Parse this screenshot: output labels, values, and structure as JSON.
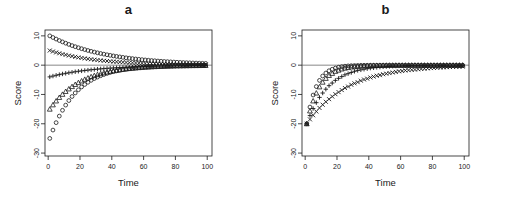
{
  "figure": {
    "panels": [
      {
        "key": "a",
        "title": "a",
        "xlabel": "Time",
        "ylabel": "Score"
      },
      {
        "key": "b",
        "title": "b",
        "xlabel": "Time",
        "ylabel": "Score"
      }
    ]
  },
  "axis": {
    "xticks": [
      0,
      20,
      40,
      60,
      80,
      100
    ],
    "yticks": [
      10,
      0,
      -10,
      -20,
      -30
    ],
    "xlim": [
      -2,
      103
    ],
    "ylim": [
      -31,
      12
    ]
  },
  "chart_data": [
    {
      "type": "scatter",
      "panel": "a",
      "title": "a",
      "xlabel": "Time",
      "ylabel": "Score",
      "xlim": [
        -2,
        103
      ],
      "ylim": [
        -31,
        12
      ],
      "xticks": [
        0,
        20,
        40,
        60,
        80,
        100
      ],
      "yticks": [
        10,
        0,
        -10,
        -20,
        -30
      ],
      "grid": false,
      "legend": "none",
      "reference_line_y": 0,
      "x": [
        1,
        3,
        5,
        7,
        9,
        11,
        13,
        15,
        17,
        19,
        21,
        23,
        25,
        27,
        29,
        31,
        33,
        35,
        37,
        39,
        41,
        43,
        45,
        47,
        49,
        51,
        53,
        55,
        57,
        59,
        61,
        63,
        65,
        67,
        69,
        71,
        73,
        75,
        77,
        79,
        81,
        83,
        85,
        87,
        89,
        91,
        93,
        95,
        97,
        99
      ],
      "series": [
        {
          "name": "start +10",
          "marker": "circle",
          "start_value": 10,
          "values": [
            10.0,
            9.44,
            8.91,
            8.41,
            7.94,
            7.5,
            7.08,
            6.68,
            6.31,
            5.96,
            5.62,
            5.31,
            5.01,
            4.73,
            4.47,
            4.22,
            3.98,
            3.76,
            3.55,
            3.35,
            3.16,
            2.99,
            2.82,
            2.66,
            2.51,
            2.37,
            2.24,
            2.11,
            1.99,
            1.88,
            1.78,
            1.68,
            1.58,
            1.5,
            1.41,
            1.33,
            1.26,
            1.19,
            1.12,
            1.06,
            1.0,
            0.94,
            0.89,
            0.84,
            0.79,
            0.75,
            0.71,
            0.67,
            0.63,
            0.6
          ]
        },
        {
          "name": "start +5",
          "marker": "cross",
          "start_value": 5,
          "values": [
            5.0,
            4.66,
            4.34,
            4.05,
            3.77,
            3.52,
            3.28,
            3.06,
            2.85,
            2.65,
            2.47,
            2.3,
            2.15,
            2.0,
            1.87,
            1.74,
            1.62,
            1.51,
            1.41,
            1.31,
            1.22,
            1.14,
            1.06,
            0.99,
            0.92,
            0.86,
            0.8,
            0.75,
            0.7,
            0.65,
            0.61,
            0.57,
            0.53,
            0.49,
            0.46,
            0.43,
            0.4,
            0.37,
            0.35,
            0.32,
            0.3,
            0.28,
            0.26,
            0.24,
            0.23,
            0.21,
            0.2,
            0.18,
            0.17,
            0.16
          ]
        },
        {
          "name": "start -4",
          "marker": "plus",
          "start_value": -4,
          "values": [
            -4.0,
            -3.72,
            -3.46,
            -3.22,
            -3.0,
            -2.79,
            -2.6,
            -2.42,
            -2.25,
            -2.09,
            -1.95,
            -1.81,
            -1.69,
            -1.57,
            -1.46,
            -1.36,
            -1.26,
            -1.18,
            -1.09,
            -1.02,
            -0.95,
            -0.88,
            -0.82,
            -0.76,
            -0.71,
            -0.66,
            -0.62,
            -0.57,
            -0.53,
            -0.5,
            -0.46,
            -0.43,
            -0.4,
            -0.37,
            -0.35,
            -0.32,
            -0.3,
            -0.28,
            -0.26,
            -0.24,
            -0.22,
            -0.21,
            -0.19,
            -0.18,
            -0.17,
            -0.16,
            -0.15,
            -0.14,
            -0.13,
            -0.12
          ]
        },
        {
          "name": "start -15",
          "marker": "triangle",
          "start_value": -15,
          "values": [
            -15.0,
            -13.53,
            -12.21,
            -11.01,
            -9.94,
            -8.96,
            -8.09,
            -7.3,
            -6.58,
            -5.94,
            -5.36,
            -4.83,
            -4.36,
            -3.93,
            -3.55,
            -3.2,
            -2.89,
            -2.6,
            -2.35,
            -2.12,
            -1.91,
            -1.73,
            -1.56,
            -1.4,
            -1.27,
            -1.14,
            -1.03,
            -0.93,
            -0.84,
            -0.76,
            -0.68,
            -0.62,
            -0.56,
            -0.5,
            -0.45,
            -0.41,
            -0.37,
            -0.33,
            -0.3,
            -0.27,
            -0.24,
            -0.22,
            -0.2,
            -0.18,
            -0.16,
            -0.14,
            -0.13,
            -0.12,
            -0.11,
            -0.1
          ]
        },
        {
          "name": "start -25",
          "marker": "circle",
          "start_value": -25,
          "values": [
            -25.0,
            -22.15,
            -19.62,
            -17.38,
            -15.4,
            -13.64,
            -12.08,
            -10.7,
            -9.48,
            -8.4,
            -7.44,
            -6.59,
            -5.84,
            -5.17,
            -4.58,
            -4.06,
            -3.6,
            -3.19,
            -2.82,
            -2.5,
            -2.21,
            -1.96,
            -1.74,
            -1.54,
            -1.36,
            -1.21,
            -1.07,
            -0.95,
            -0.84,
            -0.74,
            -0.66,
            -0.58,
            -0.52,
            -0.46,
            -0.41,
            -0.36,
            -0.32,
            -0.28,
            -0.25,
            -0.22,
            -0.2,
            -0.17,
            -0.15,
            -0.14,
            -0.12,
            -0.11,
            -0.1,
            -0.09,
            -0.08,
            -0.07
          ]
        }
      ]
    },
    {
      "type": "scatter",
      "panel": "b",
      "title": "b",
      "xlabel": "Time",
      "ylabel": "Score",
      "xlim": [
        -2,
        103
      ],
      "ylim": [
        -31,
        12
      ],
      "xticks": [
        0,
        20,
        40,
        60,
        80,
        100
      ],
      "yticks": [
        10,
        0,
        -10,
        -20,
        -30
      ],
      "grid": false,
      "legend": "none",
      "reference_line_y": 0,
      "x": [
        1,
        3,
        5,
        7,
        9,
        11,
        13,
        15,
        17,
        19,
        21,
        23,
        25,
        27,
        29,
        31,
        33,
        35,
        37,
        39,
        41,
        43,
        45,
        47,
        49,
        51,
        53,
        55,
        57,
        59,
        61,
        63,
        65,
        67,
        69,
        71,
        73,
        75,
        77,
        79,
        81,
        83,
        85,
        87,
        89,
        91,
        93,
        95,
        97,
        99
      ],
      "series": [
        {
          "name": "fast recovery",
          "marker": "circle",
          "start_value": -20,
          "values": [
            -20.0,
            -14.3,
            -10.2,
            -7.3,
            -5.2,
            -3.7,
            -2.7,
            -1.9,
            -1.4,
            -1.0,
            -0.7,
            -0.5,
            -0.35,
            -0.25,
            -0.18,
            -0.13,
            -0.1,
            -0.07,
            -0.05,
            -0.04,
            -0.03,
            -0.02,
            -0.015,
            -0.01,
            -0.008,
            -0.006,
            -0.004,
            -0.003,
            -0.002,
            -0.002,
            -0.001,
            -0.001,
            -0.001,
            0.0,
            0.0,
            0.0,
            0.0,
            0.0,
            0.0,
            0.0,
            0.0,
            0.0,
            0.0,
            0.0,
            0.0,
            0.0,
            0.0,
            0.0,
            0.0,
            0.0
          ]
        },
        {
          "name": "moderate recovery",
          "marker": "triangle",
          "start_value": -20,
          "values": [
            -20.0,
            -15.6,
            -12.2,
            -9.5,
            -7.4,
            -5.8,
            -4.5,
            -3.5,
            -2.8,
            -2.1,
            -1.7,
            -1.3,
            -1.0,
            -0.8,
            -0.6,
            -0.5,
            -0.4,
            -0.3,
            -0.24,
            -0.19,
            -0.15,
            -0.11,
            -0.09,
            -0.07,
            -0.05,
            -0.04,
            -0.03,
            -0.025,
            -0.02,
            -0.015,
            -0.012,
            -0.009,
            -0.007,
            -0.006,
            -0.004,
            -0.003,
            -0.003,
            -0.002,
            -0.002,
            -0.001,
            -0.001,
            -0.001,
            -0.001,
            0.0,
            0.0,
            0.0,
            0.0,
            0.0,
            0.0,
            0.0
          ]
        },
        {
          "name": "slow recovery",
          "marker": "plus",
          "start_value": -20,
          "values": [
            -20.0,
            -17.2,
            -14.8,
            -12.8,
            -11.0,
            -9.5,
            -8.2,
            -7.0,
            -6.1,
            -5.2,
            -4.5,
            -3.9,
            -3.3,
            -2.9,
            -2.5,
            -2.1,
            -1.8,
            -1.6,
            -1.4,
            -1.2,
            -1.0,
            -0.9,
            -0.77,
            -0.66,
            -0.57,
            -0.49,
            -0.42,
            -0.36,
            -0.31,
            -0.27,
            -0.23,
            -0.2,
            -0.17,
            -0.15,
            -0.13,
            -0.11,
            -0.09,
            -0.08,
            -0.07,
            -0.06,
            -0.05,
            -0.04,
            -0.04,
            -0.03,
            -0.03,
            -0.02,
            -0.02,
            -0.02,
            -0.01,
            -0.01
          ]
        },
        {
          "name": "slowest recovery",
          "marker": "cross",
          "start_value": -20,
          "values": [
            -20.0,
            -18.5,
            -17.1,
            -15.8,
            -14.6,
            -13.5,
            -12.5,
            -11.6,
            -10.7,
            -9.9,
            -9.2,
            -8.5,
            -7.8,
            -7.3,
            -6.7,
            -6.2,
            -5.8,
            -5.3,
            -4.9,
            -4.6,
            -4.2,
            -3.9,
            -3.6,
            -3.4,
            -3.1,
            -2.9,
            -2.7,
            -2.5,
            -2.3,
            -2.1,
            -2.0,
            -1.8,
            -1.7,
            -1.6,
            -1.5,
            -1.4,
            -1.3,
            -1.2,
            -1.1,
            -1.0,
            -0.95,
            -0.88,
            -0.81,
            -0.75,
            -0.7,
            -0.64,
            -0.6,
            -0.55,
            -0.51,
            -0.47
          ]
        }
      ]
    }
  ],
  "style": {
    "axis_color": "#1a1a1a",
    "marker_color": "#1a1a1a",
    "reference_line_color": "#555555",
    "background": "#ffffff"
  }
}
